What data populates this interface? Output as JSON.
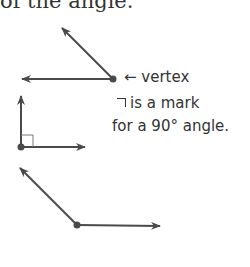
{
  "header": {
    "partial_text": "of the angle."
  },
  "annotations": {
    "vertex_label": "← vertex",
    "right_angle_note_line1": "¬ is a mark",
    "right_angle_note_line2": "for a 90° angle."
  },
  "figures": [
    {
      "name": "obtuse-angle-1",
      "vertex": [
        113,
        79
      ],
      "rays": [
        [
          62,
          28
        ],
        [
          22,
          79
        ]
      ]
    },
    {
      "name": "right-angle",
      "vertex": [
        21,
        147
      ],
      "rays": [
        [
          21,
          96
        ],
        [
          85,
          147
        ]
      ],
      "right_angle_mark": true
    },
    {
      "name": "obtuse-angle-2",
      "vertex": [
        77,
        225
      ],
      "rays": [
        [
          20,
          168
        ],
        [
          160,
          226
        ]
      ]
    }
  ],
  "colors": {
    "stroke": "#4a4a4a",
    "text": "#333333"
  }
}
